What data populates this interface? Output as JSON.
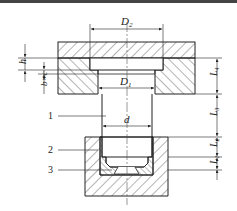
{
  "figure": {
    "type": "mechanical-section-drawing",
    "dimensions": {
      "D2": {
        "main": "D",
        "sub": "2"
      },
      "D1": {
        "main": "D",
        "sub": "1"
      },
      "d": {
        "main": "d"
      },
      "h": {
        "main": "h"
      },
      "bxc": {
        "main": "b×c"
      },
      "L1": {
        "main": "L",
        "sub": "1"
      },
      "L2": {
        "main": "L",
        "sub": "2"
      },
      "L3": {
        "main": "L",
        "sub": "3"
      },
      "L4": {
        "main": "L",
        "sub": "4"
      }
    },
    "callouts": [
      {
        "num": "1"
      },
      {
        "num": "2"
      },
      {
        "num": "3"
      }
    ],
    "colors": {
      "line": "#222222",
      "hatch": "#444444",
      "background": "#ffffff"
    }
  }
}
